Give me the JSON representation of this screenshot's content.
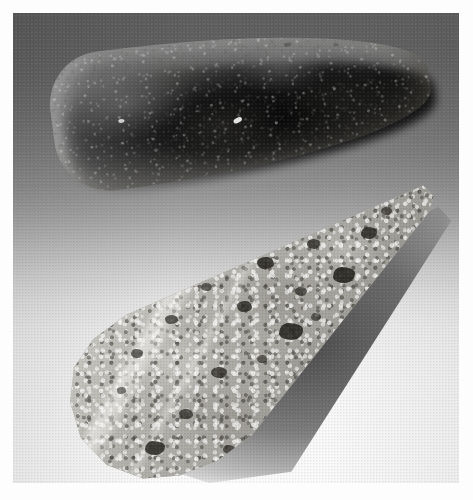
{
  "image": {
    "kind": "photograph",
    "subject": "Two polished stone celts (ungrooved axe heads) displayed on a graduated studio backdrop",
    "color_mode": "grayscale",
    "width_px": 473,
    "height_px": 500,
    "caption": "Two ground-stone celts shown in plan view, the upper of fine light stone and the lower of speckled granitic rock"
  },
  "frame": {
    "margin_label": "white photographic border",
    "plate_left_px": 13,
    "plate_top_px": 13,
    "plate_width_px": 446,
    "plate_height_px": 470,
    "border_color": "#fdfdfd"
  },
  "backdrop": {
    "label": "studio sweep backdrop",
    "gradient_direction": "vertical",
    "top_color": "#5c5c5c",
    "mid_color": "#b4b4b4",
    "bottom_color": "#fafafa",
    "description": "Seamless graduated sweep running from medium-dark grey at the top to near white at the bottom"
  },
  "artifacts": [
    {
      "id": "celt-upper",
      "name": "upper celt",
      "shape": "elongated teardrop / narrow ovate",
      "orientation": "long axis roughly horizontal, tilted about 7 degrees, bit at left and poll tapering to a point at right",
      "material_appearance": "fine-grained light stone, uniform pale grey-tan with a pecked and ground surface",
      "surface_texture": "finely granular, evenly mottled, no large inclusions",
      "base_color": "#c6c5be",
      "highlight_color": "#ded D d6",
      "shadow_color": "#1a1a18",
      "cast_shadow": "dark shadow hugging the lower-right edge, falling to the right",
      "approx_bounds_px": {
        "x": 53,
        "y": 41,
        "w": 372,
        "h": 137
      }
    },
    {
      "id": "celt-lower",
      "name": "lower celt",
      "shape": "triangular wedge with broad rounded butt and tapering pointed tip",
      "orientation": "long axis diagonal, broad rounded butt at lower left and point at upper right",
      "material_appearance": "coarse speckled granitic / diorite stone with abundant dark mineral inclusions",
      "surface_texture": "coarsely crystalline speckle of light feldspar with black hornblende blotches, crossed by a pale quartz vein",
      "base_color": "#b4b2ac",
      "speck_light_color": "#f2f1ec",
      "speck_dark_color": "#26241f",
      "vein_color": "#fbfbf8",
      "shadow_color": "#4a4a48",
      "cast_shadow": "soft grey shadow along the lower-right flank",
      "approx_bounds_px": {
        "x": 62,
        "y": 180,
        "w": 358,
        "h": 288
      }
    }
  ],
  "lighting": {
    "key_light_direction": "upper left",
    "shadow_direction": "lower right",
    "contrast": "medium-high"
  },
  "text_overlays": []
}
